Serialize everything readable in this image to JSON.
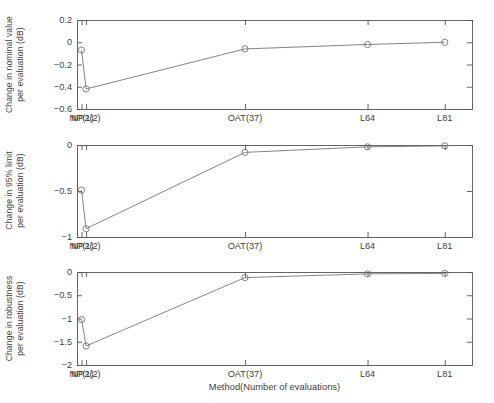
{
  "figure": {
    "xlabel": "Method(Number of evaluations)",
    "background": "#ffffff",
    "axis_color": "#555555",
    "line_color": "#6e6e6e",
    "marker_color": "#6e6e6e"
  },
  "chart_data": [
    {
      "type": "line",
      "title": "",
      "panel_index": 1,
      "ylabel": "Change in nominal value per evaluation (dB)",
      "ylabel_lines": [
        "Change in nominal value",
        "per evaluation (dB)"
      ],
      "xlabel": "",
      "categories": [
        "NP(1)",
        "NP2(2)",
        "OAT(37)",
        "L64",
        "L81"
      ],
      "x": [
        1,
        2,
        37,
        64,
        81
      ],
      "values": [
        -0.07,
        -0.42,
        -0.06,
        -0.02,
        0.0
      ],
      "ylim": [
        -0.6,
        0.2
      ],
      "yticks": [
        0.2,
        0,
        -0.2,
        -0.4,
        -0.6
      ],
      "ytick_labels": [
        "0.2",
        "0",
        "−0.2",
        "−0.4",
        "−0.6"
      ],
      "xlim": [
        0,
        87
      ],
      "grid": false,
      "legend": "none",
      "marker": "circle"
    },
    {
      "type": "line",
      "title": "",
      "panel_index": 2,
      "ylabel": "Change in 95% limit per evaluation (dB)",
      "ylabel_lines": [
        "Change in 95% limit",
        "per evaluation (dB)"
      ],
      "xlabel": "",
      "categories": [
        "NP(1)",
        "NP2(2)",
        "OAT(37)",
        "L64",
        "L81"
      ],
      "x": [
        1,
        2,
        37,
        64,
        81
      ],
      "values": [
        -0.49,
        -0.91,
        -0.08,
        -0.02,
        -0.01
      ],
      "ylim": [
        -1,
        0
      ],
      "yticks": [
        0,
        -0.5,
        -1
      ],
      "ytick_labels": [
        "0",
        "−0.5",
        "−1"
      ],
      "xlim": [
        0,
        87
      ],
      "grid": false,
      "legend": "none",
      "marker": "circle"
    },
    {
      "type": "line",
      "title": "",
      "panel_index": 3,
      "ylabel": "Change in robustness per evaluation (dB)",
      "ylabel_lines": [
        "Change in robustness",
        "per evaluation (dB)"
      ],
      "xlabel": "Method(Number of evaluations)",
      "categories": [
        "NP(1)",
        "NP2(2)",
        "OAT(37)",
        "L64",
        "L81"
      ],
      "x": [
        1,
        2,
        37,
        64,
        81
      ],
      "values": [
        -1.02,
        -1.59,
        -0.12,
        -0.04,
        -0.03
      ],
      "ylim": [
        -2,
        0
      ],
      "yticks": [
        0,
        -0.5,
        -1,
        -1.5,
        -2
      ],
      "ytick_labels": [
        "0",
        "−0.5",
        "−1",
        "−1.5",
        "−2"
      ],
      "xlim": [
        0,
        87
      ],
      "grid": false,
      "legend": "none",
      "marker": "circle"
    }
  ]
}
